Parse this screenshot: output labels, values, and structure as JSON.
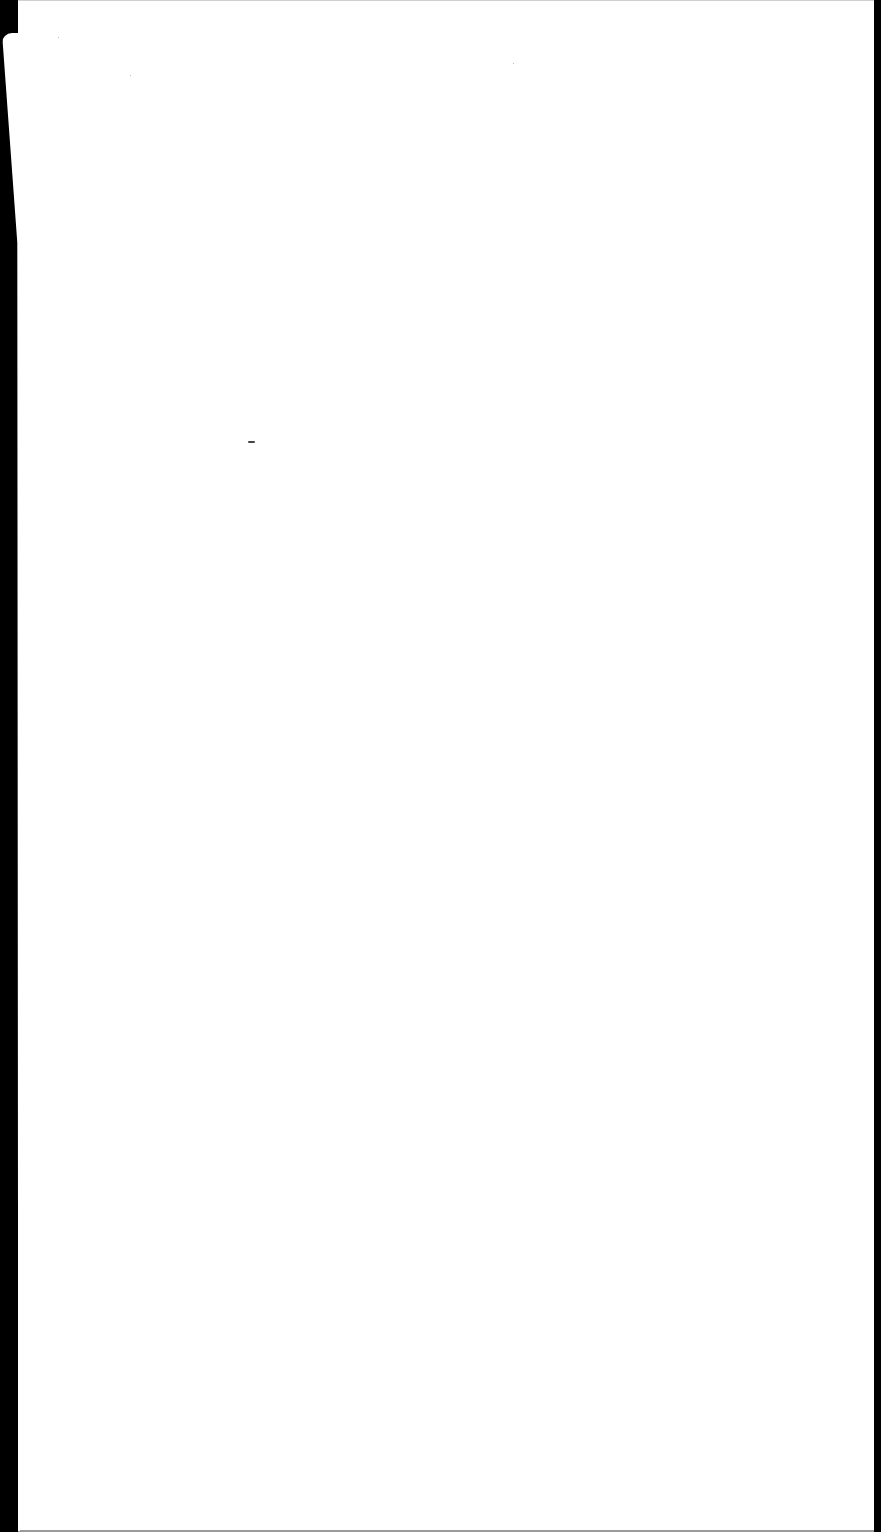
{
  "document": {
    "type": "blank-scanned-page",
    "text_content": "",
    "colors": {
      "paper": "#ffffff",
      "background": "#000000",
      "speck": "#444444"
    }
  }
}
